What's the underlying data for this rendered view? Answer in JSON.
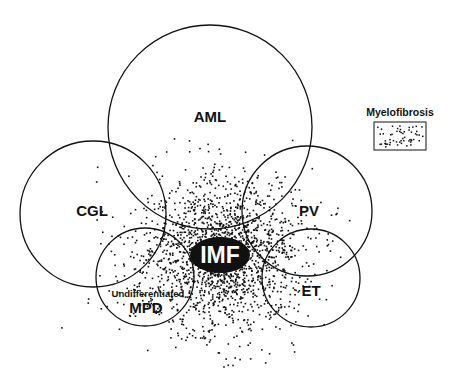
{
  "diagram": {
    "type": "venn-scatter",
    "colors": {
      "stroke": "#111111",
      "dots": "#111111",
      "background": "#ffffff",
      "center_label_text": "#ffffff"
    },
    "circles": [
      {
        "id": "aml",
        "label": "AML",
        "cx": 210,
        "cy": 127,
        "r": 102,
        "label_x": 210,
        "label_y": 122
      },
      {
        "id": "cgl",
        "label": "CGL",
        "cx": 93,
        "cy": 214,
        "r": 73,
        "label_x": 92,
        "label_y": 216
      },
      {
        "id": "pv",
        "label": "PV",
        "cx": 307,
        "cy": 211,
        "r": 65,
        "label_x": 309,
        "label_y": 216
      },
      {
        "id": "mpd",
        "label": "MPD",
        "sublabel": "Undifferentiated",
        "cx": 145,
        "cy": 277,
        "r": 49,
        "label_x": 146,
        "label_y": 313,
        "sublabel_x": 148,
        "sublabel_y": 297
      },
      {
        "id": "et",
        "label": "ET",
        "cx": 311,
        "cy": 278,
        "r": 49,
        "label_x": 311,
        "label_y": 296
      }
    ],
    "center": {
      "label": "IMF",
      "x": 220,
      "y": 255
    },
    "scatter": {
      "center_x": 220,
      "center_y": 255,
      "count": 1900,
      "spread_x": 46,
      "spread_y": 42
    },
    "legend": {
      "title": "Myelofibrosis",
      "box": {
        "x": 374,
        "y": 122,
        "w": 52,
        "h": 28
      }
    }
  }
}
